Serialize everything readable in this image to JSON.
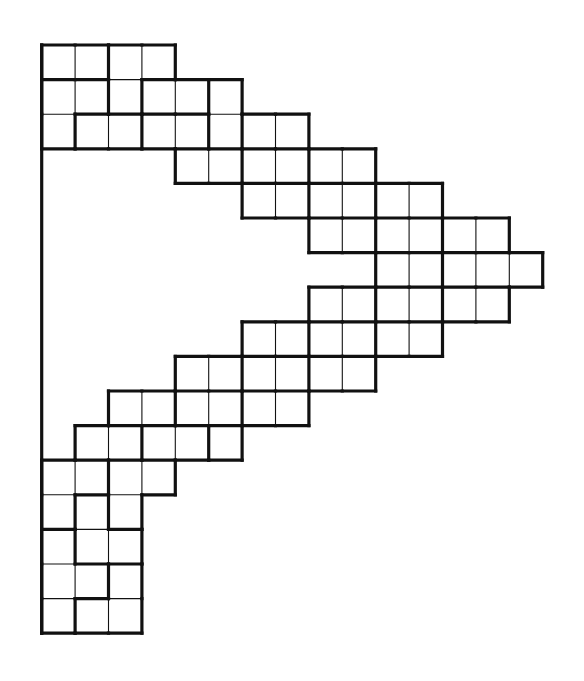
{
  "figure": {
    "colors": {
      "background": "#ffffff",
      "line": "#111111"
    },
    "grid": {
      "origin_x": 41.7,
      "origin_y": 45,
      "cell_w": 33.4,
      "cell_h": 34.6,
      "rows": 17,
      "cols": 15
    },
    "row_spans": [
      [
        0,
        3
      ],
      [
        0,
        5
      ],
      [
        0,
        7
      ],
      [
        4,
        9
      ],
      [
        6,
        11
      ],
      [
        8,
        13
      ],
      [
        10,
        14
      ],
      [
        8,
        13
      ],
      [
        6,
        11
      ],
      [
        4,
        9
      ],
      [
        2,
        7
      ],
      [
        1,
        5
      ],
      [
        0,
        3
      ],
      [
        0,
        2
      ],
      [
        0,
        2
      ],
      [
        0,
        2
      ],
      [
        0,
        2
      ]
    ],
    "pieces": [
      [
        "A",
        "A",
        "C",
        "C"
      ],
      [
        "B",
        "B",
        "C",
        "D",
        "D",
        "E"
      ],
      [
        "B",
        "F",
        "F",
        "G",
        "G",
        "E",
        "H",
        "H"
      ],
      [
        "I",
        "I",
        "J",
        "J",
        "K",
        "K"
      ],
      [
        "L",
        "L",
        "M",
        "M",
        "N",
        "N"
      ],
      [
        "O",
        "O",
        "P",
        "P",
        "Q",
        "Q"
      ],
      [
        "R",
        "R",
        "S",
        "S",
        "S"
      ],
      [
        "T",
        "T",
        "U",
        "U",
        "V",
        "V"
      ],
      [
        "W",
        "W",
        "X",
        "X",
        "Y",
        "Y"
      ],
      [
        "Z",
        "Z",
        "a",
        "a",
        "b",
        "b"
      ],
      [
        "c",
        "c",
        "d",
        "d",
        "e",
        "e"
      ],
      [
        "f",
        "f",
        "g",
        "g",
        "h"
      ],
      [
        "L1",
        "L1",
        "L3",
        "L3"
      ],
      [
        "L1",
        "L2",
        "L3"
      ],
      [
        "L4",
        "L2",
        "L2"
      ],
      [
        "L4",
        "L4",
        "L5"
      ],
      [
        "L4",
        "L5",
        "L5"
      ]
    ],
    "left_border_line": {
      "x": 41.7,
      "from_row": 0,
      "to_row": 17
    }
  }
}
